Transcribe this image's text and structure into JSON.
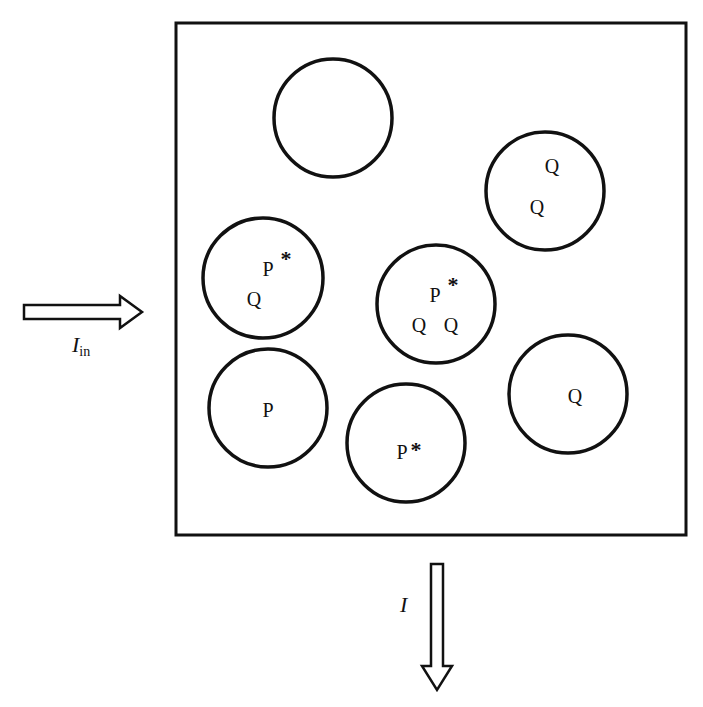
{
  "diagram": {
    "container": {
      "x": 176,
      "y": 23,
      "width": 510,
      "height": 512,
      "stroke": "#111111"
    },
    "cells": [
      {
        "id": "cell-empty",
        "cx": 333,
        "cy": 118,
        "r": 59,
        "labels": []
      },
      {
        "id": "cell-q-q",
        "cx": 545,
        "cy": 191,
        "r": 59,
        "labels": [
          {
            "text": "Q",
            "x": 552,
            "y": 173
          },
          {
            "text": "Q",
            "x": 537,
            "y": 214
          }
        ]
      },
      {
        "id": "cell-pstar-q",
        "cx": 263,
        "cy": 278,
        "r": 60,
        "labels": [
          {
            "text": "P",
            "x": 268,
            "y": 276,
            "star": true
          },
          {
            "text": "Q",
            "x": 254,
            "y": 306
          }
        ]
      },
      {
        "id": "cell-pstar-q-q",
        "cx": 436,
        "cy": 304,
        "r": 59,
        "labels": [
          {
            "text": "P",
            "x": 435,
            "y": 302,
            "star": true
          },
          {
            "text": "Q",
            "x": 419,
            "y": 332
          },
          {
            "text": "Q",
            "x": 451,
            "y": 332
          }
        ]
      },
      {
        "id": "cell-p",
        "cx": 268,
        "cy": 408,
        "r": 59,
        "labels": [
          {
            "text": "P",
            "x": 268,
            "y": 417
          }
        ]
      },
      {
        "id": "cell-pstar",
        "cx": 406,
        "cy": 443,
        "r": 59,
        "labels": [
          {
            "text": "P",
            "x": 402,
            "y": 459,
            "star": true,
            "inlineStar": true
          }
        ]
      },
      {
        "id": "cell-q",
        "cx": 568,
        "cy": 394,
        "r": 59,
        "labels": [
          {
            "text": "Q",
            "x": 575,
            "y": 403
          }
        ]
      }
    ],
    "input_arrow": {
      "label_main": "I",
      "label_sub": "in",
      "direction": "right"
    },
    "output_arrow": {
      "label_main": "I",
      "direction": "down"
    },
    "star_symbol": "*"
  }
}
